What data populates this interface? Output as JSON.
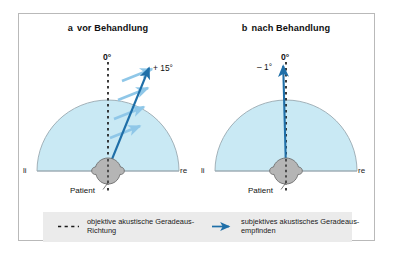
{
  "figure": {
    "colors": {
      "field_fill": "#c9e9f4",
      "field_stroke": "#8fa3ad",
      "arrow_blue": "#1f6fa8",
      "motion_arrow": "#8fc7e8",
      "head_fill": "#b5b5b5",
      "head_stroke": "#6e6e6e",
      "frame": "#b9b9b9",
      "legend_bg": "#ebebeb"
    }
  },
  "panels": [
    {
      "letter": "a",
      "title": "vor Behandlung",
      "zero_label": "0°",
      "deviation_label": "+ 15°",
      "left_label": "li",
      "right_label": "re",
      "patient_label": "Patient",
      "subjective_angle_deg": 15,
      "motion_arrows": 4
    },
    {
      "letter": "b",
      "title": "nach Behandlung",
      "zero_label": "0°",
      "deviation_label": "– 1°",
      "left_label": "li",
      "right_label": "re",
      "patient_label": "Patient",
      "subjective_angle_deg": -1,
      "motion_arrows": 0
    }
  ],
  "legend": {
    "items": [
      {
        "key": "dashed-line-key",
        "line1": "objektive akustische Geradeaus-",
        "line2": "Richtung"
      },
      {
        "key": "blue-arrow-key",
        "line1": "subjektives akustisches Geradeaus-",
        "line2": "empfinden"
      }
    ]
  }
}
